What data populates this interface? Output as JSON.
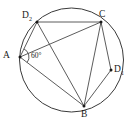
{
  "figure": {
    "type": "circle-geometry-diagram",
    "background_color": "#ffffff",
    "stroke_color": "#3a3a3a",
    "label_color": "#1a1a1a",
    "circle": {
      "center_x": 71.5,
      "center_y": 60,
      "radius": 52
    },
    "points": [
      {
        "id": "A",
        "label": "A",
        "sub": "",
        "x": 20,
        "y": 57,
        "label_x": 3,
        "label_y": 51,
        "dot": true
      },
      {
        "id": "D2",
        "label": "D",
        "sub": "2",
        "x": 37,
        "y": 22,
        "label_x": 22,
        "label_y": 11,
        "dot": true
      },
      {
        "id": "C",
        "label": "C",
        "sub": "",
        "x": 101,
        "y": 22,
        "label_x": 99,
        "label_y": 10,
        "dot": true
      },
      {
        "id": "D1",
        "label": "D",
        "sub": "1",
        "x": 111,
        "y": 70,
        "label_x": 114,
        "label_y": 65,
        "dot": true
      },
      {
        "id": "B",
        "label": "B",
        "sub": "",
        "x": 84,
        "y": 106,
        "label_x": 81,
        "label_y": 110,
        "dot": true
      }
    ],
    "chords": [
      {
        "from": "D2",
        "to": "C",
        "name": "chord-d2-c"
      },
      {
        "from": "D2",
        "to": "A",
        "name": "chord-d2-a"
      },
      {
        "from": "D2",
        "to": "B",
        "name": "chord-d2-b"
      },
      {
        "from": "A",
        "to": "C",
        "name": "chord-a-c"
      },
      {
        "from": "A",
        "to": "B",
        "name": "chord-a-b"
      },
      {
        "from": "C",
        "to": "B",
        "name": "chord-c-b"
      },
      {
        "from": "C",
        "to": "D1",
        "name": "chord-c-d1"
      },
      {
        "from": "D1",
        "to": "B",
        "name": "chord-d1-b"
      }
    ],
    "angle_marks": [
      {
        "id": "angle-at-A",
        "vertex": "A",
        "value": "60",
        "unit": "°",
        "text": "60°",
        "label_x": 31,
        "label_y": 52,
        "arc_radius": 9
      }
    ]
  }
}
